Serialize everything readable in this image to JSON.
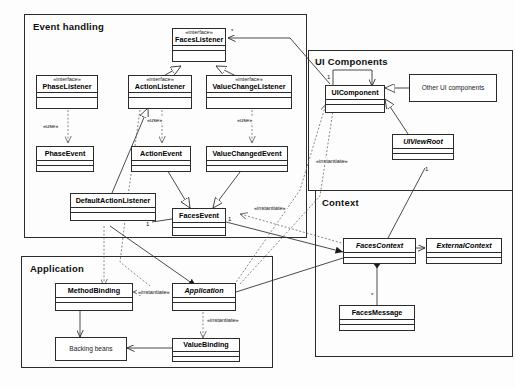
{
  "diagram": {
    "stereotype_interface": "«interface»",
    "label_use": "«use»",
    "label_instantiate": "«instantiate»",
    "mult_one": "1",
    "mult_many": "*",
    "colors": {
      "line": "#2b2b2b",
      "text": "#101010",
      "background": "#fdfdfd"
    }
  },
  "packages": [
    {
      "name": "event-handling",
      "title": "Event handling"
    },
    {
      "name": "ui-components",
      "title": "UI Components"
    },
    {
      "name": "context",
      "title": "Context"
    },
    {
      "name": "application",
      "title": "Application"
    }
  ],
  "classes": {
    "faces_listener": {
      "stereotype": "«interface»",
      "name": "FacesListener"
    },
    "phase_listener": {
      "stereotype": "«interface»",
      "name": "PhaseListener"
    },
    "action_listener": {
      "stereotype": "«interface»",
      "name": "ActionListener"
    },
    "value_change_listener": {
      "stereotype": "«interface»",
      "name": "ValueChangeListener"
    },
    "phase_event": {
      "stereotype": "",
      "name": "PhaseEvent"
    },
    "action_event": {
      "stereotype": "",
      "name": "ActionEvent"
    },
    "value_changed_event": {
      "stereotype": "",
      "name": "ValueChangedEvent"
    },
    "default_action_listener": {
      "stereotype": "",
      "name": "DefaultActionListener"
    },
    "faces_event": {
      "stereotype": "",
      "name": "FacesEvent"
    },
    "ui_component": {
      "stereotype": "",
      "name": "UIComponent"
    },
    "ui_view_root": {
      "stereotype": "",
      "name": "UIViewRoot"
    },
    "other_ui_components": {
      "stereotype": "",
      "name": "Other UI components"
    },
    "faces_context": {
      "stereotype": "",
      "name": "FacesContext"
    },
    "external_context": {
      "stereotype": "",
      "name": "ExternalContext"
    },
    "faces_message": {
      "stereotype": "",
      "name": "FacesMessage"
    },
    "method_binding": {
      "stereotype": "",
      "name": "MethodBinding"
    },
    "application": {
      "stereotype": "",
      "name": "Application"
    },
    "value_binding": {
      "stereotype": "",
      "name": "ValueBinding"
    },
    "backing_beans": {
      "stereotype": "",
      "name": "Backing beans"
    }
  },
  "edge_labels": {
    "use_action": "«use»",
    "use_phase": "«use»",
    "use_valuechange": "«use»",
    "instantiate_faces_event": "«instantiate»",
    "instantiate_ui_component": "«instantiate»",
    "instantiate_method_binding": "«instantiate»",
    "instantiate_value_binding": "«instantiate»"
  },
  "multiplicities": {
    "faces_listener_many": "*",
    "ui_component_many": "*",
    "ui_component_one": "1",
    "ui_view_root_one": "1",
    "default_listener_one": "1",
    "faces_event_one": "1",
    "faces_message_many": "*"
  }
}
